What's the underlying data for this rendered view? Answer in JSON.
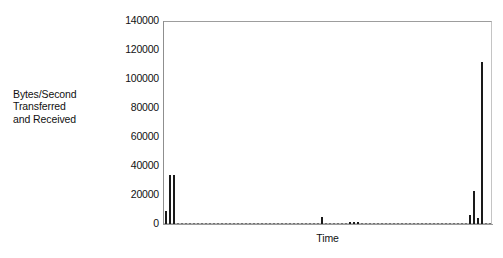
{
  "chart_data": {
    "type": "bar",
    "title": "",
    "subtitle": "",
    "xlabel": "Time",
    "ylabel": "Bytes/Second Transferred and Received",
    "ylabel_lines": [
      "Bytes/Second",
      "Transferred",
      "and Received"
    ],
    "ylim": [
      0,
      140000
    ],
    "ytick_labels": [
      "140000",
      "120000",
      "100000",
      "80000",
      "60000",
      "40000",
      "20000",
      "0"
    ],
    "ytick_values": [
      140000,
      120000,
      100000,
      80000,
      60000,
      40000,
      20000,
      0
    ],
    "xtick_labels": [],
    "grid": false,
    "legend": null,
    "bar_color": "#1a1a1a",
    "frame_color": "#b9b9b9",
    "background_color": "#ffffff",
    "series": [
      {
        "name": "Bytes/Second Transferred and Received",
        "x": [
          1,
          2,
          3,
          4,
          5,
          6,
          7,
          8,
          9,
          10,
          11,
          12,
          13,
          14,
          15,
          16,
          17,
          18,
          19,
          20,
          21,
          22,
          23,
          24,
          25,
          26,
          27,
          28,
          29,
          30,
          31,
          32,
          33,
          34,
          35,
          36,
          37,
          38,
          39,
          40,
          41,
          42,
          43,
          44,
          45,
          46,
          47,
          48,
          49,
          50,
          51,
          52,
          53,
          54,
          55,
          56,
          57,
          58,
          59,
          60,
          61,
          62,
          63,
          64,
          65,
          66,
          67,
          68,
          69,
          70,
          71,
          72,
          73,
          74,
          75,
          76,
          77,
          78,
          79,
          80,
          81,
          82
        ],
        "values": [
          9000,
          33500,
          34000,
          500,
          300,
          200,
          400,
          250,
          200,
          600,
          300,
          200,
          400,
          250,
          300,
          200,
          500,
          300,
          200,
          400,
          250,
          300,
          200,
          600,
          300,
          200,
          350,
          250,
          300,
          200,
          450,
          300,
          200,
          400,
          300,
          250,
          200,
          400,
          300,
          4500,
          300,
          200,
          350,
          250,
          300,
          200,
          1500,
          1600,
          1400,
          300,
          250,
          200,
          400,
          300,
          250,
          200,
          350,
          300,
          250,
          200,
          400,
          300,
          250,
          200,
          350,
          300,
          250,
          200,
          300,
          250,
          200,
          350,
          300,
          250,
          200,
          300,
          6000,
          23000,
          4000,
          112000,
          200,
          150
        ]
      }
    ],
    "notable_points": [
      {
        "label": "initial burst peak",
        "value": 34000
      },
      {
        "label": "mid-series spike",
        "value": 4500
      },
      {
        "label": "final spike peak",
        "value": 112000
      }
    ]
  }
}
